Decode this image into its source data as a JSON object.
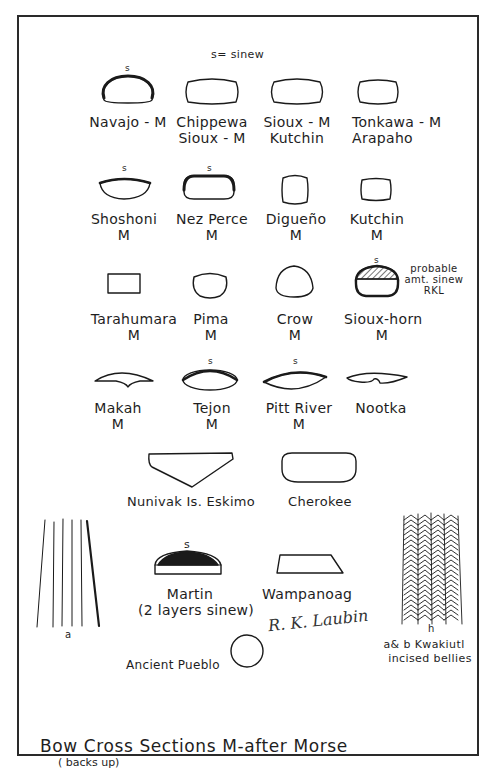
{
  "legend": "s= sinew",
  "sinew_mark": "s",
  "rows": [
    {
      "items": [
        {
          "name": "Navajo - M",
          "line2": "",
          "shape": "half-dome",
          "sinew": true
        },
        {
          "name": "Chippewa",
          "line2": "Sioux - M",
          "shape": "rounded-rect",
          "sinew": false
        },
        {
          "name": "Sioux - M",
          "line2": "Kutchin",
          "shape": "rounded-rect",
          "sinew": false
        },
        {
          "name": "Tonkawa - M",
          "line2": "Arapaho",
          "shape": "rounded-rect",
          "sinew": false
        }
      ]
    },
    {
      "items": [
        {
          "name": "Shoshoni",
          "line2": "M",
          "shape": "flat-oval",
          "sinew": true
        },
        {
          "name": "Nez Perce",
          "line2": "M",
          "shape": "rounded-rect-thick-top",
          "sinew": true
        },
        {
          "name": "Digueño",
          "line2": "M",
          "shape": "rounded-square",
          "sinew": false
        },
        {
          "name": "Kutchin",
          "line2": "M",
          "shape": "rounded-square",
          "sinew": false
        }
      ]
    },
    {
      "items": [
        {
          "name": "Tarahumara",
          "line2": "M",
          "shape": "rectangle",
          "sinew": false
        },
        {
          "name": "Pima",
          "line2": "M",
          "shape": "u-shape",
          "sinew": false
        },
        {
          "name": "Crow",
          "line2": "M",
          "shape": "egg",
          "sinew": false
        },
        {
          "name": "Sioux-horn",
          "line2": "M",
          "shape": "hatched-dome",
          "sinew": true,
          "note": [
            "probable",
            "amt. sinew",
            "RKL"
          ]
        }
      ]
    },
    {
      "items": [
        {
          "name": "Makah",
          "line2": "M",
          "shape": "notched-crescent",
          "sinew": false
        },
        {
          "name": "Tejon",
          "line2": "M",
          "shape": "lens",
          "sinew": true
        },
        {
          "name": "Pitt River",
          "line2": "M",
          "shape": "lens",
          "sinew": true
        },
        {
          "name": "Nootka",
          "line2": "",
          "shape": "notched-lens",
          "sinew": false
        }
      ]
    },
    {
      "items": [
        {
          "name": "Nunivak Is. Eskimo",
          "line2": "",
          "shape": "triangle-keel",
          "sinew": false
        },
        {
          "name": "Cherokee",
          "line2": "",
          "shape": "wide-rounded-rect",
          "sinew": false
        }
      ]
    },
    {
      "items": [
        {
          "name": "Martin",
          "line2": "(2 layers sinew)",
          "shape": "hatched-dome-flat",
          "sinew": true
        },
        {
          "name": "Wampanoag",
          "line2": "",
          "shape": "trapezoid",
          "sinew": false
        }
      ]
    },
    {
      "items": [
        {
          "name": "Ancient Pueblo",
          "line2": "",
          "shape": "circle",
          "sinew": false
        }
      ]
    }
  ],
  "belly_a_label": "a",
  "belly_b_label": "h",
  "kwakiutl_note": [
    "a& b Kwakiutl",
    "incised bellies"
  ],
  "signature": "R. K. Laubin",
  "title": "Bow Cross Sections   M-after Morse",
  "subtitle": "( backs up)"
}
